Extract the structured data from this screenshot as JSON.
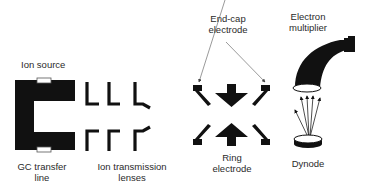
{
  "diagram": {
    "type": "ion-trap-mass-spectrometer-schematic",
    "labels": {
      "ion_source": "Ion source",
      "gc_transfer_line_1": "GC transfer",
      "gc_transfer_line_2": "line",
      "ion_lenses_1": "Ion transmission",
      "ion_lenses_2": "lenses",
      "end_cap_1": "End-cap",
      "end_cap_2": "electrode",
      "ring_1": "Ring",
      "ring_2": "electrode",
      "multiplier_1": "Electron",
      "multiplier_2": "multiplier",
      "dynode": "Dynode"
    },
    "colors": {
      "fill": "#111111",
      "text": "#2a2a2a",
      "arrow": "#555555",
      "background": "#ffffff"
    },
    "components": [
      "Ion source",
      "GC transfer line",
      "Ion transmission lenses",
      "End-cap electrode",
      "Ring electrode",
      "Electron multiplier",
      "Dynode"
    ]
  }
}
